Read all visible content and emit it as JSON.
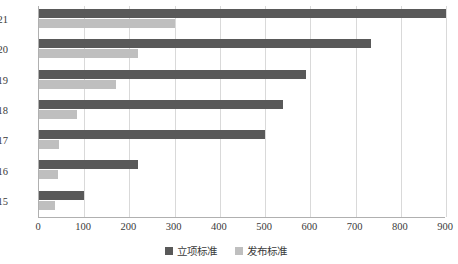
{
  "chart_data": {
    "type": "bar",
    "orientation": "horizontal",
    "title": "",
    "xlabel": "",
    "ylabel": "",
    "categories": [
      "2021",
      "2020",
      "2019",
      "2018",
      "2017",
      "2016",
      "2015"
    ],
    "series": [
      {
        "name": "立项标准",
        "color": "#595959",
        "values": [
          900,
          735,
          590,
          540,
          500,
          218,
          100
        ]
      },
      {
        "name": "发布标准",
        "color": "#bfbfbf",
        "values": [
          300,
          220,
          170,
          85,
          45,
          43,
          35
        ]
      }
    ],
    "xlim": [
      0,
      900
    ],
    "xticks": [
      0,
      100,
      200,
      300,
      400,
      500,
      600,
      700,
      800,
      900
    ],
    "xtick_labels": [
      "0",
      "100",
      "200",
      "300",
      "400",
      "500",
      "600",
      "700",
      "800",
      "900"
    ],
    "grid": true,
    "grid_axis": "x",
    "legend_position": "bottom"
  }
}
